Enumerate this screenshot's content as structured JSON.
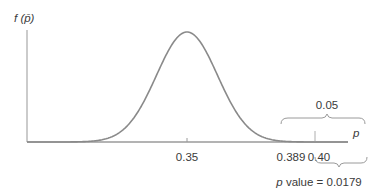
{
  "figure": {
    "y_axis_label": "f (p̄)",
    "x_axis_label": "p",
    "ticks": [
      {
        "value": "0.35",
        "x": 187
      },
      {
        "value": "0.389",
        "x": 281
      },
      {
        "value": "0.40",
        "x": 315
      }
    ],
    "upper_brace_label": "0.05",
    "lower_brace_label": "p value = 0.0179",
    "lower_brace_label_p": "p",
    "lower_brace_label_rest": " value = 0.0179",
    "colors": {
      "curve": "#8a8a8a",
      "axis": "#9a9a9a",
      "shade_dark": "#7f858a",
      "shade_light": "#a4a9ad",
      "text": "#3a3a3a"
    }
  },
  "chart_data": {
    "type": "area",
    "title": "",
    "xlabel": "p",
    "ylabel": "f(p̄)",
    "distribution": "normal",
    "mean": 0.35,
    "critical_value": 0.389,
    "observed_value": 0.4,
    "tick_labels": [
      "0.35",
      "0.389",
      "0.40"
    ],
    "shaded_regions": [
      {
        "from": 0.389,
        "to": "inf",
        "area": 0.05,
        "label": "0.05"
      },
      {
        "from": 0.4,
        "to": "inf",
        "area": 0.0179,
        "label": "p value = 0.0179"
      }
    ],
    "grid": false,
    "legend": null
  }
}
